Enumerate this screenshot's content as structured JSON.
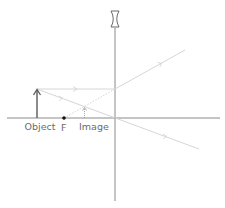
{
  "diagram": {
    "type": "diverging-lens-ray-diagram",
    "labels": {
      "object": "Object",
      "focal_point": "F",
      "image": "Image"
    },
    "lens": "diverging",
    "colors": {
      "axis": "#8a8a8a",
      "object": "#5a5a5a",
      "ray": "#d6d6d6",
      "focal_point": "#111111",
      "image": "#9a9a9a"
    }
  }
}
